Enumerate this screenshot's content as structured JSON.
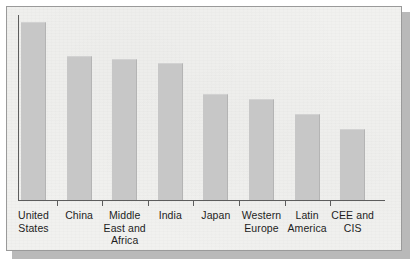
{
  "figure": {
    "panel_background": "#f1f1ef",
    "frame_border_color": "#9a9a9a",
    "shadow_color": "#b9b9b9",
    "axis_color": "#5d5d5d",
    "bar_color": "#c7c7c7",
    "label_color": "#1d1d1d"
  },
  "chart_data": {
    "type": "bar",
    "title": "",
    "subtitle": "",
    "xlabel": "",
    "ylabel": "",
    "grid": false,
    "legend": null,
    "axis_tick_labels_y": [],
    "ylim": [
      0,
      100
    ],
    "categories": [
      "United States",
      "China",
      "Middle East and Africa",
      "India",
      "Japan",
      "Western Europe",
      "Latin America",
      "CEE and CIS"
    ],
    "category_lines": [
      [
        "United",
        "States"
      ],
      [
        "China"
      ],
      [
        "Middle",
        "East and",
        "Africa"
      ],
      [
        "India"
      ],
      [
        "Japan"
      ],
      [
        "Western",
        "Europe"
      ],
      [
        "Latin",
        "America"
      ],
      [
        "CEE and",
        "CIS"
      ]
    ],
    "values": [
      100,
      81,
      79,
      77,
      60,
      57,
      49,
      41
    ],
    "bar_pixel_tops": [
      21,
      55,
      58,
      62,
      93,
      98,
      113,
      128
    ],
    "baseline_pixel_y": 199
  }
}
